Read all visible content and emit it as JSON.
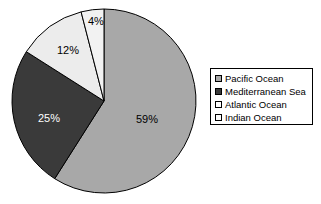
{
  "chart_data": {
    "type": "pie",
    "title": "",
    "labels": [
      "Pacific Ocean",
      "Mediterranean Sea",
      "Atlantic Ocean",
      "Indian Ocean"
    ],
    "values": [
      59,
      25,
      12,
      4
    ],
    "value_labels": [
      "59%",
      "25%",
      "12%",
      "4%"
    ],
    "colors": [
      "#a8a8a8",
      "#3a3a3a",
      "#ececec",
      "#f2f2f2"
    ],
    "start_angle_deg": 0,
    "direction": "clockwise",
    "legend_position": "right",
    "grid": false,
    "units": "percent"
  },
  "legend": {
    "entries": [
      {
        "label": "Pacific Ocean",
        "color": "#a8a8a8"
      },
      {
        "label": "Mediterranean Sea",
        "color": "#3a3a3a"
      },
      {
        "label": "Atlantic Ocean",
        "color": "#ffffff"
      },
      {
        "label": "Indian Ocean",
        "color": "#fbfbfb"
      }
    ]
  },
  "slices": {
    "pacific": {
      "value_label": "59%",
      "text_color": "#000000"
    },
    "mediterranean": {
      "value_label": "25%",
      "text_color": "#ffffff"
    },
    "atlantic": {
      "value_label": "12%",
      "text_color": "#000000"
    },
    "indian": {
      "value_label": "4%",
      "text_color": "#000000"
    }
  },
  "style": {
    "outline": "#000000",
    "background": "#ffffff"
  }
}
